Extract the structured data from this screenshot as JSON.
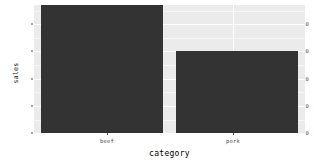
{
  "chart_data": {
    "type": "bar",
    "title": "",
    "subtitle": "",
    "categories": [
      "beef",
      "pork"
    ],
    "values": [
      47,
      30
    ],
    "series": [
      {
        "name": "sales",
        "values": [
          47,
          30
        ]
      }
    ],
    "xlabel": "category",
    "ylabel": "sales",
    "ylim": [
      0,
      47
    ],
    "yticks": [
      0,
      10,
      20,
      30,
      40
    ],
    "ytick_labels": [
      "0",
      "10",
      "20",
      "30",
      "40"
    ],
    "xtick_labels": [
      "beef",
      "pork"
    ],
    "grid": true,
    "legend": false,
    "legend_position": "none",
    "bar_color": "#333333",
    "panel_background": "#ebebeb",
    "gridline_color": "#ffffff",
    "axis_text_color": "#4d4d4d",
    "axis_title_color": "#000000",
    "plot_background": "#ffffff"
  }
}
